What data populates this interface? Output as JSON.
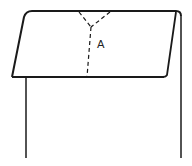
{
  "diagram": {
    "type": "line-illustration",
    "labels": [
      {
        "id": "A",
        "text": "A",
        "x": 101,
        "y": 48
      }
    ],
    "colors": {
      "stroke": "#1a1a1a",
      "background": "#ffffff"
    }
  }
}
